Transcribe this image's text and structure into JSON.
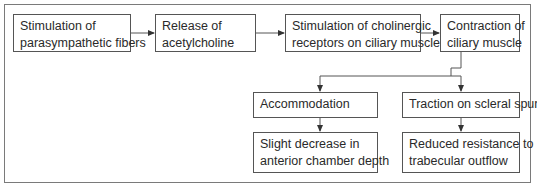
{
  "diagram": {
    "type": "flowchart",
    "row1": [
      {
        "line1": "Stimulation of",
        "line2": "parasympathetic fibers"
      },
      {
        "line1": "Release of",
        "line2": "acetylcholine"
      },
      {
        "line1": "Stimulation of cholinergic",
        "line2": "receptors on ciliary muscle"
      },
      {
        "line1": "Contraction of",
        "line2": "ciliary muscle"
      }
    ],
    "row2": [
      {
        "line1": "Accommodation"
      },
      {
        "line1": "Traction on scleral spur"
      }
    ],
    "row3": [
      {
        "line1": "Slight decrease in",
        "line2": "anterior chamber depth"
      },
      {
        "line1": "Reduced resistance to",
        "line2": "trabecular outflow"
      }
    ],
    "colors": {
      "border": "#555555",
      "frame": "#7a7a7a",
      "text": "#2a2a2a"
    }
  }
}
